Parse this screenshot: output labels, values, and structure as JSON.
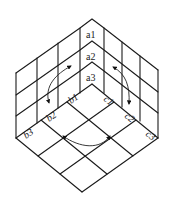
{
  "diagram": {
    "type": "cube-corner-grid",
    "grid_size": 3,
    "labels": {
      "a": [
        "a1",
        "a2",
        "a3"
      ],
      "b": [
        "b1",
        "b2",
        "b3"
      ],
      "c": [
        "c1",
        "c2",
        "c3"
      ]
    },
    "arrows": [
      {
        "face": "left",
        "direction": "bidirectional-curved"
      },
      {
        "face": "right",
        "direction": "bidirectional-curved"
      },
      {
        "face": "bottom",
        "direction": "bidirectional-curved"
      }
    ],
    "colors": {
      "line": "#1a1a1a",
      "background": "#ffffff"
    }
  }
}
